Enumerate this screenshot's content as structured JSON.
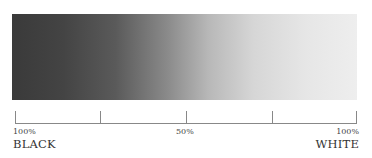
{
  "scale": {
    "gradient": {
      "start_color": "#3a3a3a",
      "end_color": "#eeeeee"
    },
    "ticks": [
      0,
      25,
      50,
      75,
      100
    ],
    "left": {
      "percent": "100%",
      "label": "BLACK"
    },
    "middle": {
      "percent": "50%"
    },
    "right": {
      "percent": "100%",
      "label": "WHITE"
    }
  }
}
